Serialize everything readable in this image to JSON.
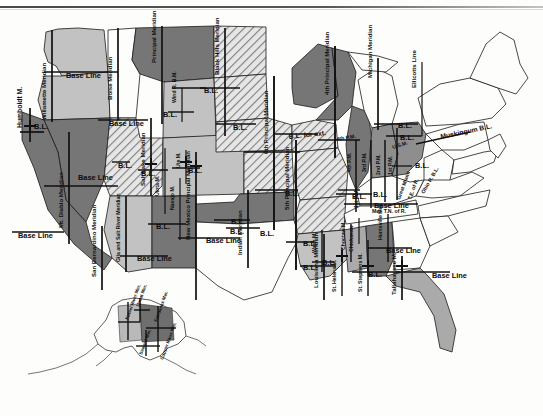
{
  "map": {
    "title": "Principal Meridians and Base Lines of the United States",
    "type": "historical-cadastral-survey-map",
    "projection_note": "Conterminous United States with Alaska inset",
    "palette": {
      "dark_gray": "#6f6f6f",
      "mid_gray": "#8e8e8e",
      "light_gray": "#b9b9b9",
      "pale_gray": "#d2d2d2",
      "hatch_gray": "#9a9a9a",
      "white": "#ffffff",
      "outline": "#1a1a1a",
      "line": "#111111",
      "paper": "#fdfdfb"
    },
    "legend_note": "Alternating gray tones distinguish adjacent survey districts; diagonal hatching marks a further district class; unshaded eastern states were surveyed under colonial/state systems."
  },
  "base_line_label": "Base Line",
  "bl_abbrev": "B.L.",
  "meridians": [
    {
      "id": "humboldt",
      "label": "Humboldt M.",
      "x": 22,
      "y": 128,
      "rot": -90,
      "size": "m"
    },
    {
      "id": "willamette",
      "label": "Willamette Meridian",
      "x": 46,
      "y": 120,
      "rot": -90,
      "size": "s"
    },
    {
      "id": "mt-diablo",
      "label": "Mt. Diablo Meridian",
      "x": 63,
      "y": 228,
      "rot": -90,
      "size": "s"
    },
    {
      "id": "san-bernardino",
      "label": "San Bernardino Meridian",
      "x": 96,
      "y": 277,
      "rot": -90,
      "size": "s"
    },
    {
      "id": "gila-salt-river",
      "label": "Gila and Salt River Meridian",
      "x": 120,
      "y": 262,
      "rot": -90,
      "size": "xs"
    },
    {
      "id": "boise",
      "label": "Boise Meridian",
      "x": 112,
      "y": 100,
      "rot": -90,
      "size": "s"
    },
    {
      "id": "salt-lake",
      "label": "Salt Lake Meridian",
      "x": 145,
      "y": 186,
      "rot": -90,
      "size": "s"
    },
    {
      "id": "uinta",
      "label": "Uinta M.",
      "x": 159,
      "y": 196,
      "rot": -90,
      "size": "xs"
    },
    {
      "id": "navajo",
      "label": "Navajo M.",
      "x": 174,
      "y": 210,
      "rot": -90,
      "size": "xs"
    },
    {
      "id": "new-mexico",
      "label": "New Mexico Principal Meridian",
      "x": 190,
      "y": 240,
      "rot": -90,
      "size": "s"
    },
    {
      "id": "principal",
      "label": "Principal Meridian",
      "x": 156,
      "y": 63,
      "rot": -90,
      "size": "s"
    },
    {
      "id": "wind-river",
      "label": "Wind R. B.M.",
      "x": 176,
      "y": 103,
      "rot": -90,
      "size": "xs"
    },
    {
      "id": "ute",
      "label": "Ute M.",
      "x": 180,
      "y": 168,
      "rot": -90,
      "size": "xs"
    },
    {
      "id": "black-hills",
      "label": "Black Hills Meridian",
      "x": 219,
      "y": 75,
      "rot": -90,
      "size": "s"
    },
    {
      "id": "sixth-principal",
      "label": "6th Principal Meridian",
      "x": 268,
      "y": 154,
      "rot": -90,
      "size": "s"
    },
    {
      "id": "indian",
      "label": "Indian Meridian",
      "x": 242,
      "y": 255,
      "rot": -90,
      "size": "s"
    },
    {
      "id": "fifth-principal",
      "label": "5th Principal Meridian",
      "x": 289,
      "y": 210,
      "rot": -90,
      "size": "s"
    },
    {
      "id": "fourth-principal",
      "label": "4th Principal Meridian",
      "x": 329,
      "y": 95,
      "rot": -90,
      "size": "s"
    },
    {
      "id": "michigan",
      "label": "Michigan Meridian",
      "x": 372,
      "y": 78,
      "rot": -90,
      "size": "s"
    },
    {
      "id": "ellicotts-line",
      "label": "Ellicotts Line",
      "x": 416,
      "y": 88,
      "rot": -90,
      "size": "s"
    },
    {
      "id": "louisiana",
      "label": "Louisiana Meridian",
      "x": 318,
      "y": 288,
      "rot": -90,
      "size": "s"
    },
    {
      "id": "st-helena",
      "label": "St. Helena M.",
      "x": 336,
      "y": 292,
      "rot": -90,
      "size": "xs"
    },
    {
      "id": "st-stephens",
      "label": "St. Stephens M.",
      "x": 362,
      "y": 292,
      "rot": -90,
      "size": "xs"
    },
    {
      "id": "tallahassee",
      "label": "Tallahassee M.",
      "x": 396,
      "y": 295,
      "rot": -90,
      "size": "s"
    },
    {
      "id": "huntsville",
      "label": "Huntsville Mer.",
      "x": 382,
      "y": 240,
      "rot": -90,
      "size": "xs"
    },
    {
      "id": "choctaw",
      "label": "Choctaw M.",
      "x": 345,
      "y": 250,
      "rot": -90,
      "size": "xs"
    },
    {
      "id": "chickasaw",
      "label": "Chickasaw",
      "x": 353,
      "y": 252,
      "rot": -90,
      "size": "xs"
    },
    {
      "id": "washington",
      "label": "Wash M.",
      "x": 316,
      "y": 253,
      "rot": -90,
      "size": "xs"
    },
    {
      "id": "mer-tn-of-r",
      "label": "Mer. T.N. of R.",
      "x": 372,
      "y": 213,
      "rot": 0,
      "size": "xs"
    },
    {
      "id": "great-miami",
      "label": "Great Miami",
      "x": 400,
      "y": 200,
      "rot": -70,
      "size": "xs"
    },
    {
      "id": "te-of-r",
      "label": "T.E. of R.",
      "x": 411,
      "y": 200,
      "rot": -70,
      "size": "xs"
    },
    {
      "id": "ohio-r-bl",
      "label": "Ohio R. B.L.",
      "x": 424,
      "y": 194,
      "rot": -60,
      "size": "xs"
    },
    {
      "id": "usm",
      "label": "U.S.M.",
      "x": 393,
      "y": 149,
      "rot": -18,
      "size": "xs"
    },
    {
      "id": "muskingum-bl",
      "label": "Muskingum B.L.",
      "x": 441,
      "y": 139,
      "rot": -12,
      "size": "m"
    },
    {
      "id": "first-pm",
      "label": "1st P.M.",
      "x": 392,
      "y": 175,
      "rot": -90,
      "size": "xs"
    },
    {
      "id": "second-pm",
      "label": "2nd P.M.",
      "x": 380,
      "y": 175,
      "rot": -90,
      "size": "xs"
    },
    {
      "id": "third-pm",
      "label": "3rd P.M.",
      "x": 366,
      "y": 172,
      "rot": -90,
      "size": "xs"
    },
    {
      "id": "fourth-pm",
      "label": "4th P.M.",
      "x": 351,
      "y": 172,
      "rot": -90,
      "size": "xs"
    },
    {
      "id": "first-pm-low",
      "label": "1st P.M.",
      "x": 358,
      "y": 208,
      "rot": -90,
      "size": "xs"
    },
    {
      "id": "fourth-pm-upper",
      "label": "4th P.M.",
      "x": 337,
      "y": 141,
      "rot": -10,
      "size": "xs"
    },
    {
      "id": "bl-for-ext",
      "label": "B.L. for ext.",
      "x": 289,
      "y": 139,
      "rot": -6,
      "size": "m"
    }
  ],
  "base_lines": [
    {
      "id": "bl-washington",
      "label": "Base Line",
      "x": 66,
      "y": 78,
      "size": "bl"
    },
    {
      "id": "bl-idaho",
      "label": "Base Line",
      "x": 109,
      "y": 126,
      "size": "bl"
    },
    {
      "id": "bl-nevada",
      "label": "Base Line",
      "x": 78,
      "y": 180,
      "size": "bl"
    },
    {
      "id": "bl-california",
      "label": "Base Line",
      "x": 18,
      "y": 238,
      "size": "bl"
    },
    {
      "id": "bl-arizona",
      "label": "Base Line",
      "x": 137,
      "y": 261,
      "size": "bl"
    },
    {
      "id": "bl-newmexico",
      "label": "Base Line",
      "x": 206,
      "y": 243,
      "size": "bl"
    },
    {
      "id": "bl-mississippi",
      "label": "Base Line",
      "x": 374,
      "y": 208,
      "size": "bl"
    },
    {
      "id": "bl-alabama",
      "label": "Base Line",
      "x": 386,
      "y": 253,
      "size": "bl"
    },
    {
      "id": "bl-florida",
      "label": "Base Line",
      "x": 432,
      "y": 278,
      "size": "bl"
    }
  ],
  "bl_marks": [
    {
      "id": "bl-humboldt",
      "label": "B.L.",
      "x": 34,
      "y": 129
    },
    {
      "id": "bl-wyoming",
      "label": "B.L.",
      "x": 163,
      "y": 117
    },
    {
      "id": "bl-blackhills",
      "label": "B.L.",
      "x": 204,
      "y": 93
    },
    {
      "id": "bl-sd",
      "label": "B.L.",
      "x": 233,
      "y": 130
    },
    {
      "id": "bl-saltlake",
      "label": "B.L.",
      "x": 141,
      "y": 176
    },
    {
      "id": "bl-utah-w",
      "label": "B.L.",
      "x": 118,
      "y": 168
    },
    {
      "id": "bl-uinta",
      "label": "B.L.",
      "x": 188,
      "y": 173
    },
    {
      "id": "bl-navajo",
      "label": "B.L.",
      "x": 156,
      "y": 229
    },
    {
      "id": "bl-colorado",
      "label": "B.L.",
      "x": 231,
      "y": 224
    },
    {
      "id": "bl-kansas",
      "label": "B.L.",
      "x": 285,
      "y": 196
    },
    {
      "id": "bl-oklahoma",
      "label": "B.L.",
      "x": 230,
      "y": 234
    },
    {
      "id": "bl-texasn",
      "label": "B.L.",
      "x": 260,
      "y": 236
    },
    {
      "id": "bl-arkansas",
      "label": "B.L.",
      "x": 303,
      "y": 246
    },
    {
      "id": "bl-louisiana",
      "label": "B.L.",
      "x": 303,
      "y": 270
    },
    {
      "id": "bl-wash-m",
      "label": "B.L.",
      "x": 322,
      "y": 265
    },
    {
      "id": "bl-stephens",
      "label": "B.L.",
      "x": 368,
      "y": 277
    },
    {
      "id": "bl-illinois",
      "label": "B.L.",
      "x": 352,
      "y": 199
    },
    {
      "id": "bl-ohio1",
      "label": "B.L.",
      "x": 398,
      "y": 128
    },
    {
      "id": "bl-ohio2",
      "label": "B.L.",
      "x": 400,
      "y": 140
    },
    {
      "id": "bl-indiana",
      "label": "B.L.",
      "x": 415,
      "y": 168
    },
    {
      "id": "bl-tn",
      "label": "B.L.",
      "x": 373,
      "y": 197
    }
  ],
  "alaska_inset": {
    "name": "alaska-inset",
    "meridians": [
      {
        "id": "kateel-river",
        "label": "Kateel River Mer.",
        "x": 128,
        "y": 320,
        "rot": -70
      },
      {
        "id": "umiat",
        "label": "Umiat Mer.",
        "x": 139,
        "y": 307,
        "rot": -70
      },
      {
        "id": "fairbanks",
        "label": "Fairbanks Mer.",
        "x": 157,
        "y": 322,
        "rot": -70
      },
      {
        "id": "seward",
        "label": "Seward Mer.",
        "x": 142,
        "y": 355,
        "rot": -70
      },
      {
        "id": "copper-river",
        "label": "Copper River Mer.",
        "x": 163,
        "y": 360,
        "rot": -70
      }
    ]
  }
}
